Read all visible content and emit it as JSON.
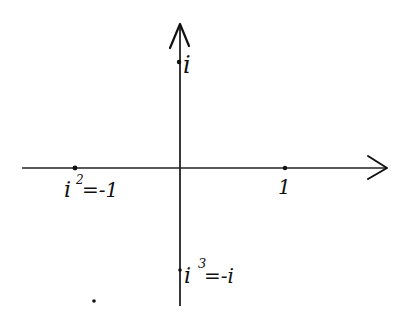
{
  "diagram": {
    "type": "complex-plane-powers-of-i",
    "colors": {
      "ink": "#111111",
      "background": "#ffffff"
    },
    "axes": {
      "horizontal": {
        "direction": "right",
        "label": ""
      },
      "vertical": {
        "direction": "up",
        "label": ""
      }
    },
    "points": [
      {
        "id": "i",
        "label": "i",
        "position": "positive-imaginary"
      },
      {
        "id": "one",
        "label": "1",
        "position": "positive-real"
      },
      {
        "id": "i-squared",
        "label_base": "i",
        "label_exp": "2",
        "label_rest": "=-1",
        "position": "negative-real"
      },
      {
        "id": "i-cubed",
        "label_base": "i",
        "label_exp": "3",
        "label_rest": "=-i",
        "position": "negative-imaginary"
      }
    ]
  }
}
